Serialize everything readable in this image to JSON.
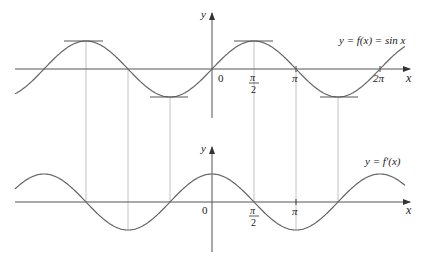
{
  "diagram": {
    "top_graph": {
      "curve_label": "y = f(x) = sin x",
      "y_axis_label": "y",
      "x_axis_label": "x",
      "origin_label": "0",
      "tick_labels": {
        "half_pi_num": "π",
        "half_pi_den": "2",
        "pi": "π",
        "two_pi": "2π"
      },
      "function": "sin",
      "horizontal_tangents_at": [
        "-3π/2",
        "-π/2",
        "π/2",
        "3π/2"
      ]
    },
    "bottom_graph": {
      "curve_label": "y = f′(x)",
      "y_axis_label": "y",
      "x_axis_label": "x",
      "origin_label": "0",
      "tick_labels": {
        "half_pi_num": "π",
        "half_pi_den": "2",
        "pi": "π"
      },
      "function": "cos"
    },
    "guide_lines_at": [
      "-3π/2",
      "-π",
      "-π/2",
      "π/2",
      "π",
      "3π/2"
    ],
    "colors": {
      "curve": "#666666",
      "axis": "#555555",
      "guide": "#bbbbbb",
      "background": "#ffffff"
    }
  }
}
